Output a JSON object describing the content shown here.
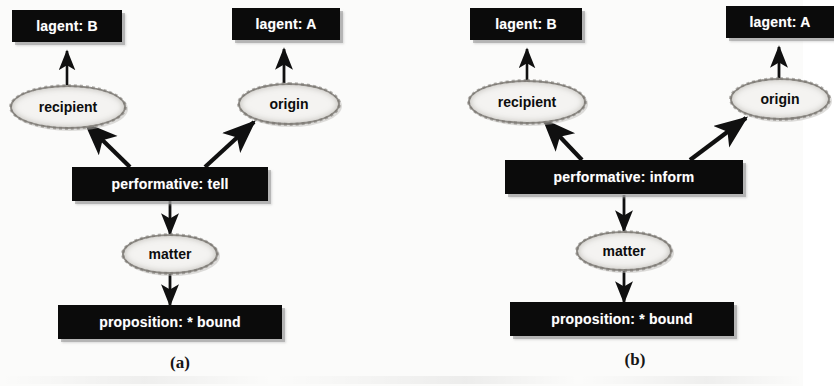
{
  "figure": {
    "type": "conceptual-graph",
    "panel_count": 2
  },
  "panels": [
    {
      "id": "a",
      "caption": "(a)",
      "concepts": [
        {
          "key": "agent_b",
          "label": "lagent: B"
        },
        {
          "key": "agent_a",
          "label": "lagent: A"
        },
        {
          "key": "performative",
          "label": "performative: tell"
        },
        {
          "key": "proposition",
          "label": "proposition: * bound"
        }
      ],
      "relations": [
        {
          "key": "recipient",
          "label": "recipient"
        },
        {
          "key": "origin",
          "label": "origin"
        },
        {
          "key": "matter",
          "label": "matter"
        }
      ],
      "edges": [
        {
          "from": "performative",
          "to": "recipient",
          "arrow": "to"
        },
        {
          "from": "recipient",
          "to": "agent_b",
          "arrow": "to"
        },
        {
          "from": "performative",
          "to": "origin",
          "arrow": "to"
        },
        {
          "from": "origin",
          "to": "agent_a",
          "arrow": "to"
        },
        {
          "from": "performative",
          "to": "matter",
          "arrow": "to"
        },
        {
          "from": "matter",
          "to": "proposition",
          "arrow": "to"
        }
      ]
    },
    {
      "id": "b",
      "caption": "(b)",
      "concepts": [
        {
          "key": "agent_b",
          "label": "lagent: B"
        },
        {
          "key": "agent_a",
          "label": "lagent: A"
        },
        {
          "key": "performative",
          "label": "performative: inform"
        },
        {
          "key": "proposition",
          "label": "proposition: * bound"
        }
      ],
      "relations": [
        {
          "key": "recipient",
          "label": "recipient"
        },
        {
          "key": "origin",
          "label": "origin"
        },
        {
          "key": "matter",
          "label": "matter"
        }
      ],
      "edges": [
        {
          "from": "performative",
          "to": "recipient",
          "arrow": "to"
        },
        {
          "from": "recipient",
          "to": "agent_b",
          "arrow": "to"
        },
        {
          "from": "performative",
          "to": "origin",
          "arrow": "to"
        },
        {
          "from": "origin",
          "to": "agent_a",
          "arrow": "to"
        },
        {
          "from": "performative",
          "to": "matter",
          "arrow": "to"
        },
        {
          "from": "matter",
          "to": "proposition",
          "arrow": "to"
        }
      ]
    }
  ],
  "colors": {
    "concept_fill": "#0b0b0b",
    "concept_text": "#ffffff",
    "relation_fill": "#f4f3f1",
    "relation_border": "#8e8b86",
    "relation_text": "#0d0d0d",
    "edge": "#101010",
    "page_background": "#fbfbfa"
  }
}
